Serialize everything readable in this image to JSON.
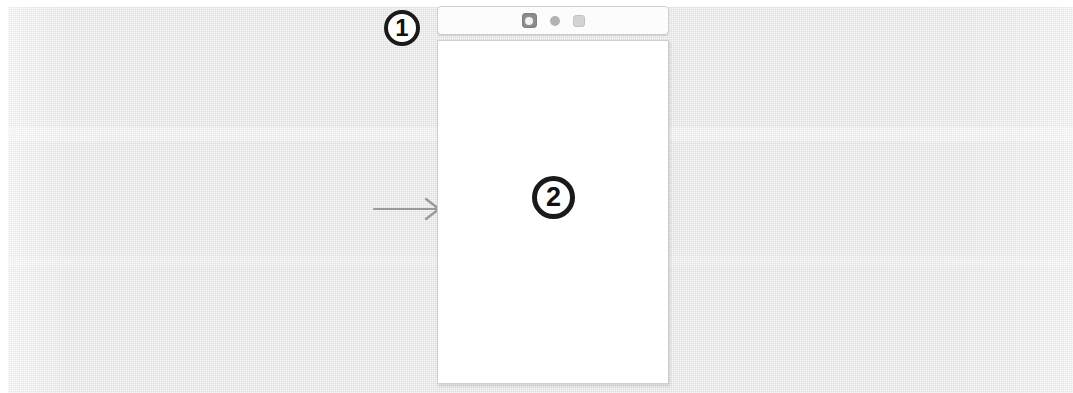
{
  "figure": {
    "background_color": "#dcdcdc",
    "paper_color": "#ffffff"
  },
  "callouts": [
    {
      "name": "callout-1",
      "label": "1",
      "points_to": "toolbar"
    },
    {
      "name": "callout-2",
      "label": "2",
      "points_to": "content-screen"
    }
  ],
  "pointer": {
    "name": "arrow-pointer",
    "icon": "arrow-right-icon",
    "color": "#9a9a9a",
    "direction": "right"
  },
  "device": {
    "toolbar": {
      "name": "device-toolbar",
      "background": "#fcfcfc",
      "border_color": "#cfcfcf",
      "icons": [
        {
          "name": "app-icon",
          "icon": "rounded-square-app-icon",
          "color": "#8d8d8d"
        },
        {
          "name": "dot-icon",
          "icon": "circle-dot-icon",
          "color": "#b3b3b3"
        },
        {
          "name": "square-icon",
          "icon": "rounded-square-icon",
          "color": "#d3d3d3"
        }
      ]
    },
    "screen": {
      "name": "content-screen",
      "background": "#ffffff",
      "content": ""
    }
  }
}
